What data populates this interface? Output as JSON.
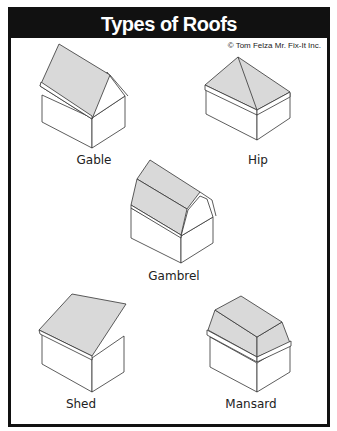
{
  "title": "Types of Roofs",
  "credit": "© Tom Felza Mr. Fix-It Inc.",
  "roofs": [
    {
      "name": "Gable"
    },
    {
      "name": "Hip"
    },
    {
      "name": "Gambrel"
    },
    {
      "name": "Shed"
    },
    {
      "name": "Mansard"
    }
  ],
  "colors": {
    "frame": "#111111",
    "roof_fill": "#d9d9d9",
    "line": "#333333"
  }
}
